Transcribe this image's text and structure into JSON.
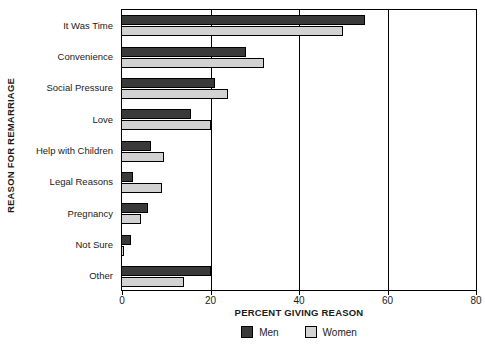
{
  "chart_data": {
    "type": "bar",
    "orientation": "horizontal",
    "title": "",
    "xlabel": "PERCENT GIVING REASON",
    "ylabel": "REASON FOR REMARRIAGE",
    "categories": [
      "It Was Time",
      "Convenience",
      "Social Pressure",
      "Love",
      "Help with Children",
      "Legal Reasons",
      "Pregnancy",
      "Not Sure",
      "Other"
    ],
    "series": [
      {
        "name": "Men",
        "color": "#3a3a3a",
        "values": [
          55,
          28,
          21,
          15.5,
          6.5,
          2.5,
          5.8,
          2,
          20
        ]
      },
      {
        "name": "Women",
        "color": "#d2d2d2",
        "values": [
          50,
          32,
          24,
          20,
          9.5,
          9,
          4.3,
          0.5,
          14
        ]
      }
    ],
    "xlim": [
      0,
      80
    ],
    "xticks": [
      0,
      20,
      40,
      60,
      80
    ],
    "xticklabels": [
      "0",
      "20",
      "40",
      "60",
      "80"
    ],
    "grid": "vertical-at-xticks",
    "legend_position": "bottom-center"
  }
}
